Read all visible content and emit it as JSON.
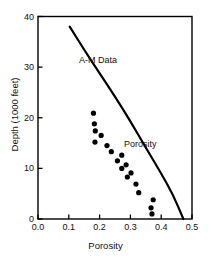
{
  "chart_data": {
    "type": "scatter",
    "title": "",
    "xlabel": "Porosity",
    "ylabel": "Depth (1000 feet)",
    "xlim": [
      0.0,
      0.5
    ],
    "ylim": [
      40,
      0
    ],
    "y_inverted": true,
    "grid": false,
    "legend": "none",
    "x_ticks": [
      0.0,
      0.1,
      0.2,
      0.3,
      0.4,
      0.5
    ],
    "x_tick_labels": [
      "0.0",
      "0.1",
      "0.2",
      "0.3",
      "0.4",
      "0.5"
    ],
    "y_ticks": [
      0,
      10,
      20,
      30,
      40
    ],
    "y_tick_labels": [
      "0",
      "10",
      "20",
      "30",
      "40"
    ],
    "annotations": [
      {
        "name": "A-M Data",
        "text": "A-M Data",
        "x": 0.235,
        "y": 8.0
      },
      {
        "name": "Porosity",
        "text": "Porosity",
        "x": 0.395,
        "y": 24.6
      }
    ],
    "series": [
      {
        "name": "A-M Data",
        "type": "scatter",
        "marker": "circle",
        "marker_size": 4,
        "color": "#000000",
        "points": [
          {
            "x": 0.37,
            "y": 1.0
          },
          {
            "x": 0.367,
            "y": 2.2
          },
          {
            "x": 0.374,
            "y": 3.8
          },
          {
            "x": 0.327,
            "y": 5.2
          },
          {
            "x": 0.318,
            "y": 6.9
          },
          {
            "x": 0.29,
            "y": 8.3
          },
          {
            "x": 0.302,
            "y": 9.1
          },
          {
            "x": 0.272,
            "y": 10.0
          },
          {
            "x": 0.286,
            "y": 10.7
          },
          {
            "x": 0.258,
            "y": 11.5
          },
          {
            "x": 0.272,
            "y": 12.6
          },
          {
            "x": 0.238,
            "y": 13.3
          },
          {
            "x": 0.224,
            "y": 14.5
          },
          {
            "x": 0.185,
            "y": 15.2
          },
          {
            "x": 0.205,
            "y": 16.5
          },
          {
            "x": 0.186,
            "y": 17.4
          },
          {
            "x": 0.183,
            "y": 18.8
          },
          {
            "x": 0.18,
            "y": 20.9
          }
        ]
      },
      {
        "name": "Porosity",
        "type": "line",
        "color": "#000000",
        "line_width": 2,
        "points": [
          {
            "x": 0.103,
            "y": 38.0
          },
          {
            "x": 0.15,
            "y": 33.4
          },
          {
            "x": 0.2,
            "y": 28.8
          },
          {
            "x": 0.25,
            "y": 24.2
          },
          {
            "x": 0.3,
            "y": 19.3
          },
          {
            "x": 0.35,
            "y": 14.1
          },
          {
            "x": 0.4,
            "y": 9.0
          },
          {
            "x": 0.44,
            "y": 4.6
          },
          {
            "x": 0.472,
            "y": 0.0
          }
        ]
      }
    ]
  },
  "axes": {
    "frame_color": "#000000"
  }
}
